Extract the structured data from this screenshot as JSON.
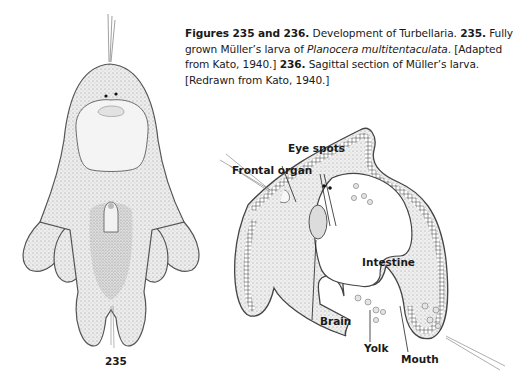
{
  "caption": {
    "heading": "Figures 235 and 236.",
    "intro": " Development of Turbellaria. ",
    "fig235_num": "235.",
    "fig235_text_a": " Fully grown Müller’s larva of ",
    "fig235_species": "Planocera multitentaculata",
    "fig235_text_b": ". [Adapted from Kato, 1940.] ",
    "fig236_num": "236.",
    "fig236_text": " Sagittal section of Müller’s larva. [Redrawn from Kato, 1940.]"
  },
  "figure_235": {
    "number": "235",
    "description": "Fully grown Müller’s larva, ventral view with eight ciliated lobes"
  },
  "figure_236": {
    "description": "Sagittal section of Müller’s larva",
    "labels": {
      "eye_spots": "Eye spots",
      "frontal_organ": "Frontal organ",
      "intestine": "Intestine",
      "brain": "Brain",
      "yolk": "Yolk",
      "mouth": "Mouth"
    }
  }
}
